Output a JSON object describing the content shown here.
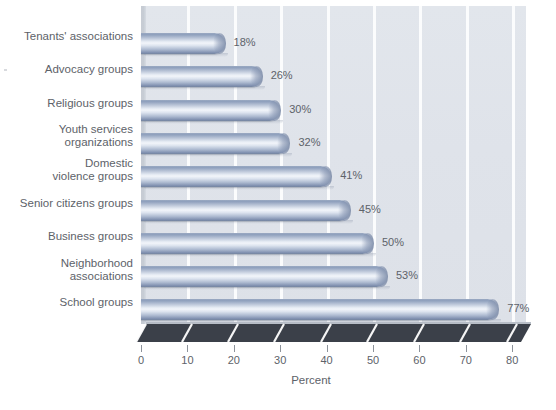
{
  "chart_data": {
    "type": "bar",
    "orientation": "horizontal",
    "title": "",
    "subtitle": "",
    "xlabel": "Percent",
    "ylabel": "",
    "xlim": [
      0,
      80
    ],
    "xticks": [
      0,
      10,
      20,
      30,
      40,
      50,
      60,
      70,
      80
    ],
    "xtick_labels": [
      "0",
      "10",
      "20",
      "30",
      "40",
      "50",
      "60",
      "70",
      "80"
    ],
    "grid": true,
    "grid_axis": "x",
    "legend": false,
    "legend_position": "none",
    "value_label_suffix": "%",
    "categories": [
      "Tenants' associations",
      "Advocacy groups",
      "Religious groups",
      "Youth services\norganizations",
      "Domestic\nviolence groups",
      "Senior citizens groups",
      "Business groups",
      "Neighborhood\nassociations",
      "School groups"
    ],
    "values": [
      18,
      26,
      30,
      32,
      41,
      45,
      50,
      53,
      77
    ],
    "value_labels": [
      "18%",
      "26%",
      "30%",
      "32%",
      "41%",
      "45%",
      "50%",
      "53%",
      "77%"
    ]
  },
  "style": {
    "plot_background": "#dfe3ea",
    "gridline_color": "#fbfcfd",
    "bar_color_light": "#f2f5fa",
    "bar_color_dark": "#74849f",
    "floor_color": "#3b4049",
    "text_color": "#5d6269",
    "page_background": "#ffffff"
  }
}
